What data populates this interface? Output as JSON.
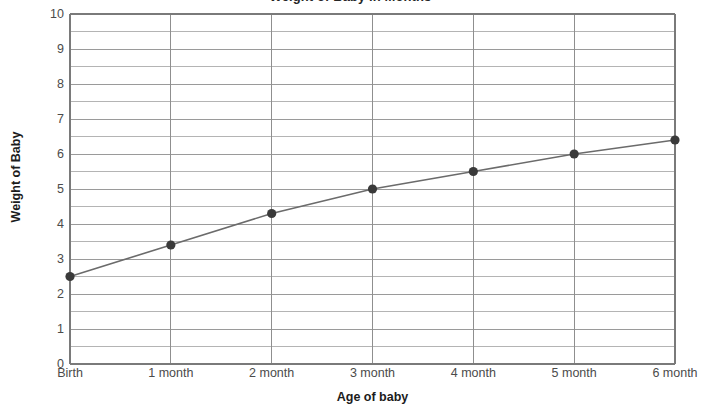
{
  "chart_data": {
    "type": "line",
    "title": "Weight of Baby in Months",
    "xlabel": "Age of baby",
    "ylabel": "Weight of Baby",
    "categories": [
      "Birth",
      "1 month",
      "2 month",
      "3 month",
      "4 month",
      "5 month",
      "6 month"
    ],
    "values": [
      2.5,
      3.4,
      4.3,
      5.0,
      5.5,
      6.0,
      6.4
    ],
    "series": [
      {
        "name": "Weight of Baby",
        "values": [
          2.5,
          3.4,
          4.3,
          5.0,
          5.5,
          6.0,
          6.4
        ]
      }
    ],
    "ylim": [
      0,
      10
    ],
    "y_major_ticks": [
      0,
      1,
      2,
      3,
      4,
      5,
      6,
      7,
      8,
      9,
      10
    ],
    "y_tick_labels": [
      "0",
      "1",
      "2",
      "3",
      "4",
      "5",
      "6",
      "7",
      "8",
      "9",
      "10"
    ],
    "y_minor_step": 0.5,
    "grid": "both",
    "legend": "none",
    "marker": "filled-circle",
    "line_color": "#6b6b6b",
    "marker_color": "#3a3a3a",
    "grid_color": "#9a9a9a",
    "axis_color": "#7a7a7a",
    "background": "#ffffff"
  }
}
